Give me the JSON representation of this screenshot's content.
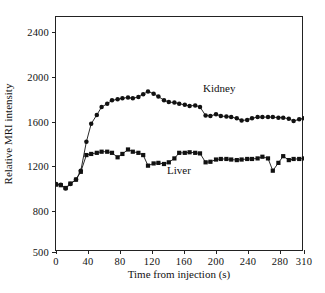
{
  "chart_data": {
    "type": "line",
    "title": "",
    "xlabel": "Time from injection (s)",
    "ylabel": "Relative MRI intensity",
    "xlim": [
      0,
      310
    ],
    "ylim": [
      500,
      2600
    ],
    "grid": false,
    "legend_position": "inline-annotation",
    "xticks": [
      0,
      40,
      80,
      120,
      160,
      200,
      240,
      280,
      310
    ],
    "xtick_labels": [
      "0",
      "40",
      "80",
      "120",
      "160",
      "200",
      "240",
      "280",
      "310"
    ],
    "yticks": [
      500,
      800,
      1200,
      1600,
      2000,
      2400
    ],
    "ytick_labels": [
      "500",
      "800",
      "1200",
      "1600",
      "2000",
      "2400"
    ],
    "series": [
      {
        "name": "Kidney",
        "marker": "circle",
        "color": "#111111",
        "label_x": 185,
        "label_y": 1880,
        "x": [
          0,
          6,
          12,
          18,
          25,
          31,
          38,
          44,
          51,
          57,
          64,
          70,
          77,
          83,
          90,
          96,
          103,
          109,
          115,
          122,
          128,
          135,
          141,
          148,
          154,
          161,
          167,
          174,
          180,
          187,
          193,
          200,
          206,
          213,
          219,
          226,
          232,
          239,
          245,
          252,
          258,
          265,
          271,
          278,
          284,
          291,
          297,
          304,
          310
        ],
        "y": [
          1040,
          1035,
          1000,
          1040,
          1080,
          1160,
          1420,
          1580,
          1660,
          1730,
          1760,
          1790,
          1800,
          1810,
          1815,
          1810,
          1820,
          1845,
          1870,
          1850,
          1825,
          1790,
          1775,
          1770,
          1760,
          1750,
          1740,
          1745,
          1730,
          1655,
          1650,
          1665,
          1650,
          1645,
          1640,
          1630,
          1610,
          1615,
          1630,
          1640,
          1640,
          1640,
          1640,
          1635,
          1635,
          1625,
          1605,
          1620,
          1630
        ]
      },
      {
        "name": "Liver",
        "marker": "square",
        "color": "#111111",
        "label_x": 140,
        "label_y": 1150,
        "x": [
          0,
          6,
          12,
          18,
          25,
          31,
          38,
          44,
          51,
          57,
          64,
          70,
          77,
          83,
          90,
          96,
          103,
          109,
          115,
          122,
          128,
          135,
          141,
          148,
          154,
          161,
          167,
          174,
          180,
          187,
          193,
          200,
          206,
          213,
          219,
          226,
          232,
          239,
          245,
          252,
          258,
          265,
          271,
          278,
          284,
          291,
          297,
          304,
          310
        ],
        "y": [
          1035,
          1030,
          1005,
          1045,
          1080,
          1150,
          1300,
          1310,
          1320,
          1330,
          1330,
          1320,
          1280,
          1310,
          1350,
          1330,
          1320,
          1300,
          1205,
          1225,
          1230,
          1220,
          1235,
          1270,
          1320,
          1320,
          1325,
          1320,
          1315,
          1235,
          1240,
          1260,
          1265,
          1265,
          1260,
          1255,
          1260,
          1265,
          1265,
          1270,
          1285,
          1270,
          1160,
          1230,
          1290,
          1255,
          1265,
          1265,
          1270
        ]
      }
    ]
  }
}
